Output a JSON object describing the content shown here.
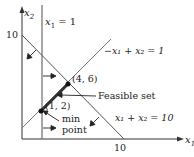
{
  "diagram": {
    "type": "linear-programming-feasible-set",
    "axes": {
      "x_label": "x",
      "x_sub": "1",
      "y_label": "x",
      "y_sub": "2",
      "x_tick": "10",
      "y_tick": "10"
    },
    "constraints": [
      {
        "id": "c1",
        "pre": "x",
        "sub1": "1",
        "rest": " = 1"
      },
      {
        "id": "c2",
        "text": "−x₁ + x₂ = 1"
      },
      {
        "id": "c3",
        "text": "x₁ + x₂ = 10"
      }
    ],
    "points": [
      {
        "label": "(4, 6)",
        "x": 4,
        "y": 6
      },
      {
        "label": "(1, 2)",
        "x": 1,
        "y": 2
      }
    ],
    "annotations": {
      "feasible_set": "Feasible set",
      "min_point_line1": "min",
      "min_point_line2": "point"
    },
    "colors": {
      "axis": "#333333",
      "line": "#777777",
      "feasible": "#444444",
      "text": "#222222"
    }
  }
}
